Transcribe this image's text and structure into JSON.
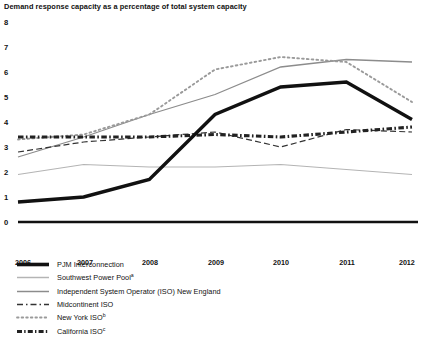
{
  "chart_data": {
    "type": "line",
    "title": "Demand response capacity as a percentage of total system capacity",
    "xlabel": "",
    "ylabel": "",
    "x": [
      2006,
      2007,
      2008,
      2009,
      2010,
      2011,
      2012
    ],
    "categories": [
      "2006",
      "2007",
      "2008",
      "2009",
      "2010",
      "2011",
      "2012"
    ],
    "xlim": [
      2006,
      2012
    ],
    "ylim": [
      0,
      8
    ],
    "y_ticks": [
      0,
      1,
      2,
      3,
      4,
      5,
      6,
      7,
      8
    ],
    "x_ticks": [
      "2006",
      "2007",
      "2008",
      "2009",
      "2010",
      "2011",
      "2012"
    ],
    "grid": false,
    "legend_position": "below-left",
    "series": [
      {
        "name": "PJM Interconnection",
        "style": "solid-thick",
        "color": "#111111",
        "values": [
          0.8,
          1.0,
          1.7,
          4.3,
          5.4,
          5.6,
          4.1
        ]
      },
      {
        "name": "Southwest Power Pool",
        "superscript": "a",
        "style": "solid-light",
        "color": "#b4b4b4",
        "values": [
          1.9,
          2.3,
          2.2,
          2.2,
          2.3,
          2.1,
          1.9
        ]
      },
      {
        "name": "Independent System Operator (ISO) New England",
        "style": "solid-medium",
        "color": "#8c8c8c",
        "values": [
          2.6,
          3.4,
          4.3,
          5.1,
          6.2,
          6.5,
          6.4
        ]
      },
      {
        "name": "Midcontinent ISO",
        "style": "dashed",
        "color": "#333333",
        "values": [
          2.8,
          3.2,
          3.4,
          3.6,
          3.0,
          3.7,
          3.6
        ]
      },
      {
        "name": "New York ISO",
        "superscript": "b",
        "style": "dotted",
        "color": "#9a9a9a",
        "values": [
          3.3,
          3.5,
          4.3,
          6.1,
          6.6,
          6.4,
          4.8
        ]
      },
      {
        "name": "California ISO",
        "superscript": "c",
        "style": "dash-dot-thick",
        "color": "#222222",
        "values": [
          3.4,
          3.4,
          3.4,
          3.5,
          3.4,
          3.6,
          3.8
        ]
      }
    ]
  },
  "legend": {
    "items": [
      {
        "label": "PJM Interconnection",
        "superscript": ""
      },
      {
        "label": "Southwest Power Pool",
        "superscript": "a"
      },
      {
        "label": "Independent System Operator (ISO) New England",
        "superscript": ""
      },
      {
        "label": "Midcontinent ISO",
        "superscript": ""
      },
      {
        "label": "New York ISO",
        "superscript": "b"
      },
      {
        "label": "California ISO",
        "superscript": "c"
      }
    ]
  },
  "axis": {
    "y_labels": [
      "8",
      "7",
      "6",
      "5",
      "4",
      "3",
      "2",
      "1",
      "0"
    ],
    "x_labels": [
      "2006",
      "2007",
      "2008",
      "2009",
      "2010",
      "2011",
      "2012"
    ]
  }
}
